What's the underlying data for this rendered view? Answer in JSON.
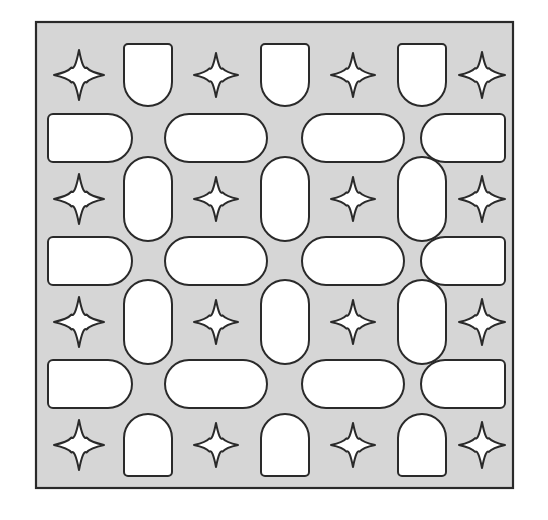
{
  "figure": {
    "canvas": {
      "width": 548,
      "height": 520,
      "background": "#ffffff"
    }
  },
  "panel": {
    "name": "perforated-panel",
    "x": 36,
    "y": 22,
    "width": 477,
    "height": 466,
    "fill": "#d6d6d6",
    "stroke": "#2a2a2a",
    "stroke_width": 2.2
  },
  "style": {
    "hole_fill": "#ffffff",
    "hole_stroke": "#2a2a2a",
    "hole_stroke_width": 2.0,
    "star_stroke_width": 2.0
  },
  "grid": {
    "rows": 7,
    "cols": 7,
    "row_centers": [
      75,
      138,
      199,
      261,
      322,
      384,
      445
    ],
    "col_centers": [
      79,
      148,
      216,
      285,
      353,
      422,
      482
    ],
    "row_kinds": [
      "odd-shapes",
      "horizontal-pills",
      "odd-shapes",
      "horizontal-pills",
      "odd-shapes",
      "horizontal-pills",
      "odd-shapes"
    ],
    "description": "Odd rows alternate star, vertical-shape, star, vertical-shape, star, vertical-shape, star. Even rows hold four wide horizontal capsules."
  },
  "shapes": {
    "star": {
      "label": "four-pointed-star",
      "count": 16,
      "radius_x": 25,
      "radius_y": 25,
      "waist": 0.3
    },
    "u_shape": {
      "label": "u-shape-flat-top-round-bottom",
      "count": 3,
      "width": 48,
      "height": 62,
      "corner_top": 4,
      "corner_bottom": 24
    },
    "arch_shape": {
      "label": "arch-round-top-flat-bottom",
      "count": 3,
      "width": 48,
      "height": 62,
      "corner_top": 24,
      "corner_bottom": 4
    },
    "vertical_pill": {
      "label": "vertical-capsule",
      "count": 6,
      "width": 48,
      "height": 84,
      "corner": 24
    },
    "horizontal_pill": {
      "label": "horizontal-capsule",
      "count": 6,
      "width": 102,
      "height": 48,
      "corner": 24
    },
    "d_left": {
      "label": "d-shape-flat-left",
      "count": 3,
      "width": 84,
      "height": 48,
      "corner_flat": 5,
      "corner_round": 24
    },
    "d_right": {
      "label": "d-shape-flat-right",
      "count": 3,
      "width": 84,
      "height": 48,
      "corner_flat": 5,
      "corner_round": 24
    }
  },
  "holes": [
    {
      "row": 1,
      "col": 1,
      "kind": "star",
      "cx": 79,
      "cy": 75,
      "w": 50,
      "h": 50
    },
    {
      "row": 1,
      "col": 2,
      "kind": "u_shape",
      "cx": 148,
      "cy": 75,
      "w": 48,
      "h": 62
    },
    {
      "row": 1,
      "col": 3,
      "kind": "star",
      "cx": 216,
      "cy": 75,
      "w": 44,
      "h": 44
    },
    {
      "row": 1,
      "col": 4,
      "kind": "u_shape",
      "cx": 285,
      "cy": 75,
      "w": 48,
      "h": 62
    },
    {
      "row": 1,
      "col": 5,
      "kind": "star",
      "cx": 353,
      "cy": 75,
      "w": 44,
      "h": 44
    },
    {
      "row": 1,
      "col": 6,
      "kind": "u_shape",
      "cx": 422,
      "cy": 75,
      "w": 48,
      "h": 62
    },
    {
      "row": 1,
      "col": 7,
      "kind": "star",
      "cx": 482,
      "cy": 75,
      "w": 46,
      "h": 46
    },
    {
      "row": 2,
      "col": 1,
      "kind": "d_left",
      "cx": 90,
      "cy": 138,
      "w": 84,
      "h": 48
    },
    {
      "row": 2,
      "col": 2,
      "kind": "horizontal_pill",
      "cx": 216,
      "cy": 138,
      "w": 102,
      "h": 48
    },
    {
      "row": 2,
      "col": 3,
      "kind": "horizontal_pill",
      "cx": 353,
      "cy": 138,
      "w": 102,
      "h": 48
    },
    {
      "row": 2,
      "col": 4,
      "kind": "d_right",
      "cx": 463,
      "cy": 138,
      "w": 84,
      "h": 48
    },
    {
      "row": 3,
      "col": 1,
      "kind": "star",
      "cx": 79,
      "cy": 199,
      "w": 50,
      "h": 50
    },
    {
      "row": 3,
      "col": 2,
      "kind": "vertical_pill",
      "cx": 148,
      "cy": 199,
      "w": 48,
      "h": 84
    },
    {
      "row": 3,
      "col": 3,
      "kind": "star",
      "cx": 216,
      "cy": 199,
      "w": 44,
      "h": 44
    },
    {
      "row": 3,
      "col": 4,
      "kind": "vertical_pill",
      "cx": 285,
      "cy": 199,
      "w": 48,
      "h": 84
    },
    {
      "row": 3,
      "col": 5,
      "kind": "star",
      "cx": 353,
      "cy": 199,
      "w": 44,
      "h": 44
    },
    {
      "row": 3,
      "col": 6,
      "kind": "vertical_pill",
      "cx": 422,
      "cy": 199,
      "w": 48,
      "h": 84
    },
    {
      "row": 3,
      "col": 7,
      "kind": "star",
      "cx": 482,
      "cy": 199,
      "w": 46,
      "h": 46
    },
    {
      "row": 4,
      "col": 1,
      "kind": "d_left",
      "cx": 90,
      "cy": 261,
      "w": 84,
      "h": 48
    },
    {
      "row": 4,
      "col": 2,
      "kind": "horizontal_pill",
      "cx": 216,
      "cy": 261,
      "w": 102,
      "h": 48
    },
    {
      "row": 4,
      "col": 3,
      "kind": "horizontal_pill",
      "cx": 353,
      "cy": 261,
      "w": 102,
      "h": 48
    },
    {
      "row": 4,
      "col": 4,
      "kind": "d_right",
      "cx": 463,
      "cy": 261,
      "w": 84,
      "h": 48
    },
    {
      "row": 5,
      "col": 1,
      "kind": "star",
      "cx": 79,
      "cy": 322,
      "w": 50,
      "h": 50
    },
    {
      "row": 5,
      "col": 2,
      "kind": "vertical_pill",
      "cx": 148,
      "cy": 322,
      "w": 48,
      "h": 84
    },
    {
      "row": 5,
      "col": 3,
      "kind": "star",
      "cx": 216,
      "cy": 322,
      "w": 44,
      "h": 44
    },
    {
      "row": 5,
      "col": 4,
      "kind": "vertical_pill",
      "cx": 285,
      "cy": 322,
      "w": 48,
      "h": 84
    },
    {
      "row": 5,
      "col": 5,
      "kind": "star",
      "cx": 353,
      "cy": 322,
      "w": 44,
      "h": 44
    },
    {
      "row": 5,
      "col": 6,
      "kind": "vertical_pill",
      "cx": 422,
      "cy": 322,
      "w": 48,
      "h": 84
    },
    {
      "row": 5,
      "col": 7,
      "kind": "star",
      "cx": 482,
      "cy": 322,
      "w": 46,
      "h": 46
    },
    {
      "row": 6,
      "col": 1,
      "kind": "d_left",
      "cx": 90,
      "cy": 384,
      "w": 84,
      "h": 48
    },
    {
      "row": 6,
      "col": 2,
      "kind": "horizontal_pill",
      "cx": 216,
      "cy": 384,
      "w": 102,
      "h": 48
    },
    {
      "row": 6,
      "col": 3,
      "kind": "horizontal_pill",
      "cx": 353,
      "cy": 384,
      "w": 102,
      "h": 48
    },
    {
      "row": 6,
      "col": 4,
      "kind": "d_right",
      "cx": 463,
      "cy": 384,
      "w": 84,
      "h": 48
    },
    {
      "row": 7,
      "col": 1,
      "kind": "star",
      "cx": 79,
      "cy": 445,
      "w": 50,
      "h": 50
    },
    {
      "row": 7,
      "col": 2,
      "kind": "arch_shape",
      "cx": 148,
      "cy": 445,
      "w": 48,
      "h": 62
    },
    {
      "row": 7,
      "col": 3,
      "kind": "star",
      "cx": 216,
      "cy": 445,
      "w": 44,
      "h": 44
    },
    {
      "row": 7,
      "col": 4,
      "kind": "arch_shape",
      "cx": 285,
      "cy": 445,
      "w": 48,
      "h": 62
    },
    {
      "row": 7,
      "col": 5,
      "kind": "star",
      "cx": 353,
      "cy": 445,
      "w": 44,
      "h": 44
    },
    {
      "row": 7,
      "col": 6,
      "kind": "arch_shape",
      "cx": 422,
      "cy": 445,
      "w": 48,
      "h": 62
    },
    {
      "row": 7,
      "col": 7,
      "kind": "star",
      "cx": 482,
      "cy": 445,
      "w": 46,
      "h": 46
    }
  ]
}
